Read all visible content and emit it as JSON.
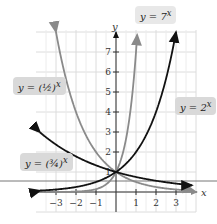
{
  "chart_data": {
    "type": "line",
    "title": "",
    "xlabel": "x",
    "ylabel": "y",
    "xlim": [
      -3.8,
      4
    ],
    "ylim": [
      -0.6,
      8.2
    ],
    "x_ticks": [
      "-3",
      "-2",
      "-1",
      "1",
      "2",
      "3"
    ],
    "y_ticks": [
      "1",
      "2",
      "3",
      "4",
      "5",
      "6",
      "7"
    ],
    "grid": true,
    "series": [
      {
        "name": "y = 7^x",
        "label": "y = 7",
        "exp": "x",
        "color": "#8a8a8a",
        "x": [
          -3.5,
          -1,
          0,
          0.5,
          1,
          1.07
        ],
        "y": [
          0.001,
          0.143,
          1,
          2.65,
          7,
          8.0
        ]
      },
      {
        "name": "y = 2^x",
        "label": "y = 2",
        "exp": "x",
        "color": "#111111",
        "x": [
          -3.8,
          -2,
          -1,
          0,
          1,
          2,
          3
        ],
        "y": [
          0.07,
          0.25,
          0.5,
          1,
          2,
          4,
          8
        ]
      },
      {
        "name": "y = (1/2)^x",
        "label": "y = (1/2)",
        "exp": "x",
        "color": "#8a8a8a",
        "x": [
          -3,
          -2,
          -1,
          0,
          1,
          2,
          3,
          3.8
        ],
        "y": [
          8,
          4,
          2,
          1,
          0.5,
          0.25,
          0.125,
          0.07
        ]
      },
      {
        "name": "y = (3/4)^x",
        "label": "y = (3/4)",
        "exp": "x",
        "color": "#111111",
        "x": [
          -3.8,
          -3,
          -2,
          -1,
          0,
          1,
          2,
          3,
          3.8
        ],
        "y": [
          2.98,
          2.37,
          1.78,
          1.33,
          1,
          0.75,
          0.56,
          0.42,
          0.34
        ]
      }
    ]
  },
  "axes": {
    "x_label": "x",
    "y_label": "y"
  },
  "labels": {
    "seven": {
      "base": "y = 7",
      "exp": "x"
    },
    "two": {
      "base": "y = 2",
      "exp": "x"
    },
    "half": {
      "pre": "y = ",
      "frac": "(½)",
      "exp": "x"
    },
    "threequarter": {
      "pre": "y = ",
      "frac": "(¾)",
      "exp": "x"
    }
  }
}
